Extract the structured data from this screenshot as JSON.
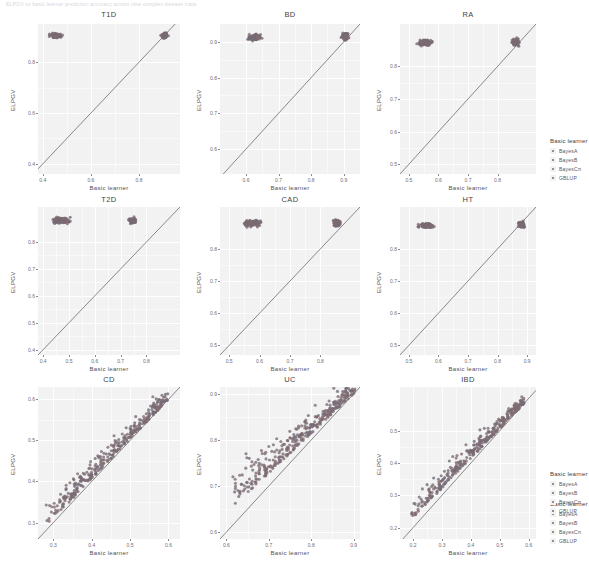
{
  "topnote": "ELPGV vs basic learner prediction accuracy across nine complex disease traits",
  "axes": {
    "xlabel": "Basic learner",
    "ylabel": "ELPGV"
  },
  "legend": {
    "title": "Basic learner",
    "items": [
      {
        "label": "BayesA",
        "color": "#7a6b74"
      },
      {
        "label": "BayesB",
        "color": "#7e6a70"
      },
      {
        "label": "BayesCπ",
        "color": "#80696e"
      },
      {
        "label": "GBLUP",
        "color": "#6f6a78"
      }
    ]
  },
  "chart_data": {
    "type": "scatter",
    "title": "ELPGV vs Basic learner prediction accuracy",
    "xlabel": "Basic learner",
    "ylabel": "ELPGV",
    "grid": true,
    "legend_position": "right",
    "reference_line": {
      "type": "identity",
      "slope": 1,
      "intercept": 0
    },
    "panels": [
      {
        "title": "T1D",
        "xlim": [
          0.38,
          0.97
        ],
        "ylim": [
          0.36,
          0.95
        ],
        "xticks": [
          0.4,
          0.6,
          0.8
        ],
        "yticks": [
          0.4,
          0.6,
          0.8
        ],
        "clusters": [
          {
            "cx": 0.455,
            "cy": 0.905,
            "sx": 0.022,
            "sy": 0.01,
            "n": 110
          },
          {
            "cx": 0.905,
            "cy": 0.905,
            "sx": 0.012,
            "sy": 0.01,
            "n": 90
          }
        ]
      },
      {
        "title": "BD",
        "xlim": [
          0.52,
          0.95
        ],
        "ylim": [
          0.53,
          0.95
        ],
        "xticks": [
          0.6,
          0.7,
          0.8,
          0.9
        ],
        "yticks": [
          0.6,
          0.7,
          0.8,
          0.9
        ],
        "clusters": [
          {
            "cx": 0.625,
            "cy": 0.912,
            "sx": 0.02,
            "sy": 0.008,
            "n": 110
          },
          {
            "cx": 0.905,
            "cy": 0.915,
            "sx": 0.01,
            "sy": 0.01,
            "n": 90
          }
        ]
      },
      {
        "title": "RA",
        "xlim": [
          0.47,
          0.93
        ],
        "ylim": [
          0.47,
          0.93
        ],
        "xticks": [
          0.5,
          0.6,
          0.7,
          0.8
        ],
        "yticks": [
          0.5,
          0.6,
          0.7,
          0.8
        ],
        "clusters": [
          {
            "cx": 0.555,
            "cy": 0.873,
            "sx": 0.022,
            "sy": 0.009,
            "n": 110
          },
          {
            "cx": 0.86,
            "cy": 0.873,
            "sx": 0.012,
            "sy": 0.012,
            "n": 95
          }
        ]
      },
      {
        "title": "T2D",
        "xlim": [
          0.38,
          0.93
        ],
        "ylim": [
          0.38,
          0.93
        ],
        "xticks": [
          0.4,
          0.5,
          0.6,
          0.7,
          0.8
        ],
        "yticks": [
          0.4,
          0.5,
          0.6,
          0.7,
          0.8
        ],
        "clusters": [
          {
            "cx": 0.47,
            "cy": 0.88,
            "sx": 0.03,
            "sy": 0.012,
            "n": 120
          },
          {
            "cx": 0.745,
            "cy": 0.88,
            "sx": 0.015,
            "sy": 0.012,
            "n": 60
          }
        ]
      },
      {
        "title": "CAD",
        "xlim": [
          0.47,
          0.93
        ],
        "ylim": [
          0.47,
          0.93
        ],
        "xticks": [
          0.5,
          0.6,
          0.7,
          0.8
        ],
        "yticks": [
          0.5,
          0.6,
          0.7,
          0.8
        ],
        "clusters": [
          {
            "cx": 0.575,
            "cy": 0.88,
            "sx": 0.025,
            "sy": 0.01,
            "n": 120
          },
          {
            "cx": 0.855,
            "cy": 0.88,
            "sx": 0.012,
            "sy": 0.01,
            "n": 70
          }
        ]
      },
      {
        "title": "HT",
        "xlim": [
          0.47,
          0.93
        ],
        "ylim": [
          0.47,
          0.93
        ],
        "xticks": [
          0.5,
          0.6,
          0.7,
          0.8,
          0.9
        ],
        "yticks": [
          0.5,
          0.6,
          0.7,
          0.8
        ],
        "clusters": [
          {
            "cx": 0.56,
            "cy": 0.872,
            "sx": 0.024,
            "sy": 0.008,
            "n": 120
          },
          {
            "cx": 0.88,
            "cy": 0.876,
            "sx": 0.01,
            "sy": 0.01,
            "n": 80
          }
        ]
      },
      {
        "title": "CD",
        "xlim": [
          0.26,
          0.63
        ],
        "ylim": [
          0.26,
          0.63
        ],
        "xticks": [
          0.3,
          0.4,
          0.5,
          0.6
        ],
        "yticks": [
          0.3,
          0.4,
          0.5,
          0.6
        ],
        "band": {
          "x0": 0.28,
          "y0": 0.29,
          "x1": 0.6,
          "y1": 0.6,
          "n": 330,
          "spread_above": 0.055,
          "spread_along": 0.0
        }
      },
      {
        "title": "UC",
        "xlim": [
          0.585,
          0.915
        ],
        "ylim": [
          0.585,
          0.915
        ],
        "xticks": [
          0.6,
          0.7,
          0.8,
          0.9
        ],
        "yticks": [
          0.6,
          0.7,
          0.8,
          0.9
        ],
        "band": {
          "x0": 0.615,
          "y0": 0.655,
          "x1": 0.905,
          "y1": 0.905,
          "n": 330,
          "spread_above": 0.07,
          "spread_along": 0.0
        }
      },
      {
        "title": "IBD",
        "xlim": [
          0.155,
          0.625
        ],
        "ylim": [
          0.165,
          0.635
        ],
        "xticks": [
          0.2,
          0.3,
          0.4,
          0.5,
          0.6
        ],
        "yticks": [
          0.2,
          0.3,
          0.4,
          0.5
        ],
        "band": {
          "x0": 0.195,
          "y0": 0.225,
          "x1": 0.585,
          "y1": 0.585,
          "n": 330,
          "spread_above": 0.062,
          "spread_along": 0.0
        }
      }
    ]
  }
}
